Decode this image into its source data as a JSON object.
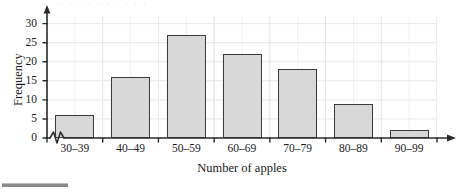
{
  "figure": {
    "top_partial_text": "· · · · · · · · · ·",
    "bottom_rule_name": "footer-rule"
  },
  "chart_data": {
    "type": "bar",
    "title": "",
    "subtitle": "",
    "xlabel": "Number of apples",
    "ylabel": "Frequency",
    "categories": [
      "30–39",
      "40–49",
      "50–59",
      "60–69",
      "70–79",
      "80–89",
      "90–99"
    ],
    "values": [
      6,
      16,
      27,
      22,
      18,
      9,
      2
    ],
    "ylim": [
      0,
      32
    ],
    "yticks": [
      0,
      5,
      10,
      15,
      20,
      25,
      30
    ],
    "ytick_labels": [
      "0",
      "5",
      "10",
      "15",
      "20",
      "25",
      "30"
    ],
    "grid": true,
    "grid_minor": true,
    "legend": null,
    "axis_break_on_x": true,
    "bar_fill": "#d7d7d7",
    "bar_edge": "#3a3a3a",
    "grid_color": "#f0eaea",
    "axis_color": "#2b2b2b"
  }
}
